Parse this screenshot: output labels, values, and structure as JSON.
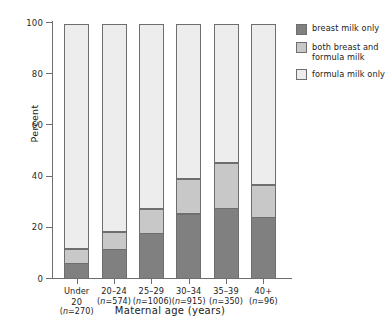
{
  "chart_data": {
    "type": "bar",
    "subtype": "stacked-bar-100",
    "title": "",
    "xlabel": "Maternal age (years)",
    "ylabel": "Percent",
    "ylim": [
      0,
      100
    ],
    "yticks": [
      0,
      20,
      40,
      60,
      80,
      100
    ],
    "ytick_labels": [
      "0",
      "20",
      "40",
      "60",
      "80",
      "100"
    ],
    "grid": false,
    "legend_position": "right",
    "categories": [
      "Under 20",
      "20–24",
      "25–29",
      "30–34",
      "35–39",
      "40+"
    ],
    "category_counts": [
      "(n=270)",
      "(n=574)",
      "(n=1006)",
      "(n=915)",
      "(n=350)",
      "(n=96)"
    ],
    "category_n_values": [
      270,
      574,
      1006,
      915,
      350,
      96
    ],
    "series": [
      {
        "name": "breast milk only",
        "color": "#808080",
        "values": [
          6,
          11.5,
          18,
          25.5,
          27.5,
          24
        ]
      },
      {
        "name": "both breast and formula milk",
        "color": "#c8c8c8",
        "values": [
          6,
          7,
          9.5,
          14,
          18,
          13
        ]
      },
      {
        "name": "formula milk only",
        "color": "#ededed",
        "values": [
          88,
          81.5,
          72.5,
          60.5,
          54.5,
          63
        ]
      }
    ],
    "cumulative_tops": [
      [
        6,
        12,
        100
      ],
      [
        11.5,
        18.5,
        100
      ],
      [
        18,
        27.5,
        100
      ],
      [
        25.5,
        39.5,
        100
      ],
      [
        27.5,
        45.5,
        100
      ],
      [
        24,
        37,
        100
      ]
    ]
  },
  "legend": {
    "items": [
      {
        "label": "breast milk only",
        "color": "#808080"
      },
      {
        "label": "both breast and formula milk",
        "color": "#c8c8c8"
      },
      {
        "label": "formula milk only",
        "color": "#ededed"
      }
    ]
  },
  "colors": {
    "axis": "#6e6e6e",
    "text": "#1a1a1a",
    "background": "#ffffff",
    "breast_milk_only": "#808080",
    "both_breast_and_formula": "#c8c8c8",
    "formula_milk_only": "#ededed"
  }
}
